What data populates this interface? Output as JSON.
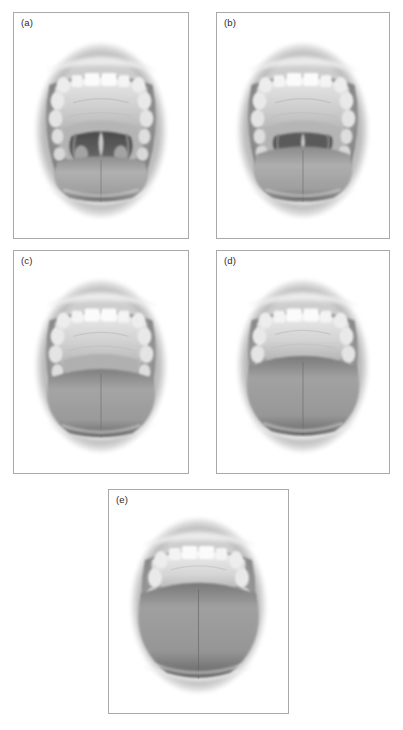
{
  "figure": {
    "kind": "anatomical-illustration-grid",
    "background_color": "#ffffff",
    "border_color": "#a9a9a9",
    "label_color": "#2b2b2b",
    "caption": "",
    "panel_count": 5
  },
  "panels": [
    {
      "id": "a",
      "label": "(a)",
      "visible_structures": "soft palate, uvula, fauces, anterior and posterior pillars, tonsils",
      "tongue_height": "low",
      "uvula_visible": true,
      "pillars_visible": true,
      "tonsils_visible": true,
      "soft_palate_visible": true,
      "hard_palate_visible": true
    },
    {
      "id": "b",
      "label": "(b)",
      "visible_structures": "soft palate, uvula partly hidden by tongue base, fauces",
      "tongue_height": "medium-low",
      "uvula_visible": true,
      "pillars_visible": true,
      "tonsils_visible": true,
      "soft_palate_visible": true,
      "hard_palate_visible": true
    },
    {
      "id": "c",
      "label": "(c)",
      "visible_structures": "soft palate and base of uvula only",
      "tongue_height": "medium-high",
      "uvula_visible": false,
      "pillars_visible": false,
      "tonsils_visible": false,
      "soft_palate_visible": true,
      "hard_palate_visible": true
    },
    {
      "id": "d",
      "label": "(d)",
      "visible_structures": "soft palate margin only",
      "tongue_height": "high",
      "uvula_visible": false,
      "pillars_visible": false,
      "tonsils_visible": false,
      "soft_palate_visible": true,
      "hard_palate_visible": true
    },
    {
      "id": "e",
      "label": "(e)",
      "visible_structures": "hard palate only, soft palate not visible",
      "tongue_height": "very-high",
      "uvula_visible": false,
      "pillars_visible": false,
      "tonsils_visible": false,
      "soft_palate_visible": false,
      "hard_palate_visible": true
    }
  ],
  "layout": {
    "rows": [
      {
        "panels": [
          "a",
          "b"
        ]
      },
      {
        "panels": [
          "c",
          "d"
        ]
      },
      {
        "panels": [
          "e"
        ]
      }
    ]
  }
}
